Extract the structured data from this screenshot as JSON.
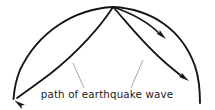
{
  "figure": {
    "kind": "seismic-wave-path-diagram",
    "background_color": "#ffffff",
    "stroke_color": "#151515",
    "leader_color": "#8a8a8a",
    "caption": "path of earthquake wave",
    "focus_point": {
      "x": 113,
      "y": 7,
      "label": "earthquake focus"
    },
    "arcs": [
      {
        "name": "outer-surface-arc-left",
        "description": "outer dome arc from focus curving left and down to surface",
        "d": "M 113 7 C 74 9 38 32 20 70 C 16 80 14 92 13.5 99"
      },
      {
        "name": "outer-surface-arc-right",
        "description": "outer dome arc from focus curving right and down to surface",
        "d": "M 113 7 C 152 9 182 30 195 66 C 199 78 200 94 200 103"
      }
    ],
    "rays": [
      {
        "name": "ray-left-deep",
        "description": "inner wave path from focus curving down-left to arrowhead at lower left",
        "d": "M 113 7 C 101 26 78 52 50 74 C 38 83 24 93 17 98",
        "arrow": {
          "x": 14.5,
          "y": 100.5,
          "angle": 216
        }
      },
      {
        "name": "ray-right-shallow",
        "description": "short wave path from focus curving right to arrowhead mid-upper-right",
        "d": "M 113 7 C 131 13 148 22 160 34",
        "arrow": {
          "x": 166,
          "y": 39,
          "angle": 42
        }
      },
      {
        "name": "ray-right-deep",
        "description": "wave path from focus curving down-right to arrowhead at lower right",
        "d": "M 113 7 C 126 21 143 44 168 65 C 174 70 180 75 183 77",
        "arrow": {
          "x": 189,
          "y": 81,
          "angle": 35
        }
      }
    ],
    "leaders": [
      {
        "name": "leader-left",
        "description": "thin leader line from caption up to left inner wave path",
        "d": "M 84 88 L 73 63"
      },
      {
        "name": "leader-right",
        "description": "thin leader line from caption up to right deep wave path",
        "d": "M 131 88 L 143 60"
      }
    ],
    "caption_position": {
      "x": 107,
      "y": 97,
      "anchor": "middle"
    }
  }
}
